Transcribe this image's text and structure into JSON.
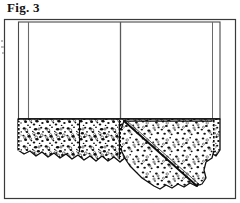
{
  "figure": {
    "label": "Fig. 3",
    "caption_position": "top-left"
  },
  "colors": {
    "background": "#ffffff",
    "ink": "#111111",
    "frame_line": "#3a3a3a",
    "panel_line": "#5a5a5a",
    "stipple": "#0d0d0d",
    "artifact": "#b9b9b9"
  },
  "diagram": {
    "type": "technical-line-drawing",
    "outer_frame": {
      "name": "border-frame",
      "x": 4,
      "y": 19,
      "width": 232,
      "height": 180,
      "stroke_width": 1.2
    },
    "fabric_panel": {
      "name": "plain-fabric-field",
      "x": 18,
      "y": 22,
      "width": 202,
      "height": 96,
      "fill": "#ffffff",
      "stroke_width": 1.1
    },
    "seams": [
      {
        "name": "left-vertical-seam",
        "x": 28,
        "y1": 22,
        "y2": 119
      },
      {
        "name": "center-vertical-seam",
        "x": 120,
        "y1": 22,
        "y2": 119
      },
      {
        "name": "right-vertical-seam",
        "x": 212,
        "y1": 22,
        "y2": 119
      }
    ],
    "lace_band": {
      "name": "lace-border-band",
      "top_y": 119,
      "left_x": 18,
      "right_x": 220,
      "band_depth": 38,
      "header_rule_y": 121,
      "description": "dense stippled lace with scalloped lower edge"
    },
    "lace_sections": [
      {
        "name": "lace-section-left",
        "x1": 18,
        "x2": 80,
        "depth": 36
      },
      {
        "name": "lace-section-center",
        "x1": 80,
        "x2": 120,
        "depth": 34
      },
      {
        "name": "lace-section-right",
        "x1": 120,
        "x2": 220,
        "depth": 40
      }
    ],
    "fold": {
      "name": "diagonal-fold-line",
      "x1": 124,
      "y1": 121,
      "x2": 196,
      "y2": 186,
      "description": "diagonal fold crossing right lace section"
    },
    "draped_flap": {
      "name": "draped-lace-flap",
      "description": "lace continues below scallop line on right side, folded forward"
    },
    "edge_hatching": [
      {
        "name": "left-edge-hatch",
        "x": 19,
        "y1": 122,
        "y2": 152
      },
      {
        "name": "center-edge-hatch",
        "x": 119,
        "y1": 122,
        "y2": 156
      },
      {
        "name": "right-edge-hatch",
        "x": 214,
        "y1": 121,
        "y2": 150
      }
    ]
  },
  "artifacts": {
    "name": "scan-edge-marks",
    "description": "faint grey scan marks at left page margin",
    "marks": [
      {
        "x": 1,
        "y": 4,
        "w": 2,
        "h": 2
      },
      {
        "x": 1,
        "y": 10,
        "w": 3,
        "h": 2
      },
      {
        "x": 2,
        "y": 16,
        "w": 2,
        "h": 2
      }
    ]
  }
}
